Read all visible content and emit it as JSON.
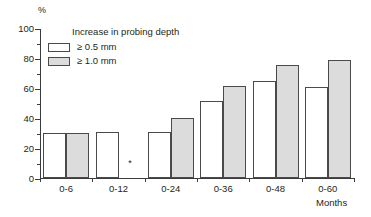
{
  "chart_data": {
    "type": "bar",
    "title": "",
    "xlabel": "Months",
    "ylabel": "%",
    "ylim": [
      0,
      100
    ],
    "yticks": [
      0,
      20,
      40,
      60,
      80,
      100
    ],
    "ytick_labels": [
      "0",
      "20",
      "40",
      "60",
      "80",
      "100"
    ],
    "grid": false,
    "legend_position": "top-left",
    "legend_title": "Increase in probing depth",
    "categories": [
      "0-6",
      "0-12",
      "0-24",
      "0-36",
      "0-48",
      "0-60"
    ],
    "series": [
      {
        "name": "≥ 0.5 mm",
        "color": "#ffffff",
        "values": [
          30,
          31,
          31,
          52,
          65,
          61
        ]
      },
      {
        "name": "≥ 1.0 mm",
        "color": "#dcdcdc",
        "values": [
          30,
          null,
          40,
          62,
          76,
          79
        ]
      }
    ],
    "annotations": [
      {
        "text": "*",
        "category": "0-12",
        "series": "≥ 1.0 mm",
        "note": "asterisk marks missing value"
      }
    ]
  },
  "axes": {
    "y_unit": "%",
    "x_unit": "Months",
    "y_tick_labels": [
      "100",
      "80",
      "60",
      "40",
      "20",
      "0"
    ],
    "x_tick_labels": [
      "0-6",
      "0-12",
      "0-24",
      "0-36",
      "0-48",
      "0-60"
    ]
  },
  "legend": {
    "title": "Increase in probing depth",
    "items": [
      {
        "label": "≥ 0.5 mm"
      },
      {
        "label": "≥ 1.0 mm"
      }
    ]
  },
  "markers": {
    "missing": "*"
  }
}
